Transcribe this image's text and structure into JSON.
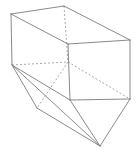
{
  "figure": {
    "canvas": {
      "width": 137,
      "height": 157,
      "background": "#ffffff"
    },
    "styles": {
      "visible_edge_color": "#7d7d7d",
      "hidden_edge_color": "#9a9a9a",
      "visible_edge_width": 0.9,
      "hidden_edge_width": 0.85,
      "hidden_edge_dash": "2 2"
    },
    "vertices": {
      "box_top_back_left": {
        "x": 11,
        "y": 14
      },
      "box_top_back_right": {
        "x": 64,
        "y": 6
      },
      "box_top_front_right": {
        "x": 130,
        "y": 40
      },
      "box_top_front_left": {
        "x": 68,
        "y": 44
      },
      "box_bot_back_left": {
        "x": 12,
        "y": 65
      },
      "box_bot_back_right": {
        "x": 68,
        "y": 62
      },
      "box_bot_front_right": {
        "x": 130,
        "y": 99
      },
      "box_bot_front_left": {
        "x": 70,
        "y": 100
      },
      "wedge_left": {
        "x": 37,
        "y": 108
      },
      "wedge_apex": {
        "x": 100,
        "y": 146
      }
    },
    "edges": {
      "visible": [
        {
          "name": "top-back-left-to-top-back-right",
          "from": "box_top_back_left",
          "to": "box_top_back_right"
        },
        {
          "name": "top-back-right-to-top-front-right",
          "from": "box_top_back_right",
          "to": "box_top_front_right"
        },
        {
          "name": "top-front-right-to-top-front-left",
          "from": "box_top_front_right",
          "to": "box_top_front_left"
        },
        {
          "name": "top-front-left-to-top-back-left",
          "from": "box_top_front_left",
          "to": "box_top_back_left"
        },
        {
          "name": "left-vertical-back",
          "from": "box_top_back_left",
          "to": "box_bot_back_left"
        },
        {
          "name": "front-left-vertical",
          "from": "box_top_front_left",
          "to": "box_bot_front_left"
        },
        {
          "name": "front-right-vertical",
          "from": "box_top_front_right",
          "to": "box_bot_front_right"
        },
        {
          "name": "bottom-front-left-to-bottom-front-right",
          "from": "box_bot_front_left",
          "to": "box_bot_front_right"
        },
        {
          "name": "back-left-to-wedge-left",
          "from": "box_bot_back_left",
          "to": "wedge_left"
        },
        {
          "name": "back-left-to-bottom-front-left",
          "from": "box_bot_back_left",
          "to": "box_bot_front_left"
        },
        {
          "name": "back-left-to-wedge-apex",
          "from": "box_bot_back_left",
          "to": "wedge_apex"
        },
        {
          "name": "wedge-left-to-wedge-apex",
          "from": "wedge_left",
          "to": "wedge_apex"
        },
        {
          "name": "bottom-front-left-to-wedge-apex",
          "from": "box_bot_front_left",
          "to": "wedge_apex"
        },
        {
          "name": "bottom-front-right-to-wedge-apex",
          "from": "box_bot_front_right",
          "to": "wedge_apex"
        }
      ],
      "hidden": [
        {
          "name": "hidden-vertical-back-right",
          "from": "box_top_back_right",
          "to": "box_bot_back_right"
        },
        {
          "name": "hidden-bottom-back-edge",
          "from": "box_bot_back_left",
          "to": "box_bot_back_right"
        },
        {
          "name": "hidden-bottom-right-diagonal",
          "from": "box_bot_back_right",
          "to": "box_bot_front_right"
        },
        {
          "name": "hidden-back-right-to-wedge-left",
          "from": "box_bot_back_right",
          "to": "wedge_left"
        }
      ]
    }
  }
}
